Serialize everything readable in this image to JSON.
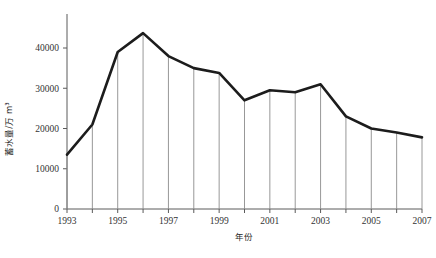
{
  "chart_data": {
    "type": "line",
    "title": "",
    "xlabel": "年份",
    "ylabel": "蓄水量/万 m³",
    "x": [
      1993,
      1994,
      1995,
      1996,
      1997,
      1998,
      1999,
      2000,
      2001,
      2002,
      2003,
      2004,
      2005,
      2006,
      2007
    ],
    "values": [
      13500,
      21000,
      39000,
      43700,
      38000,
      35000,
      33800,
      27000,
      29500,
      29000,
      31000,
      23000,
      20000,
      19000,
      17800
    ],
    "series": [
      {
        "name": "蓄水量",
        "values": [
          13500,
          21000,
          39000,
          43700,
          38000,
          35000,
          33800,
          27000,
          29500,
          29000,
          31000,
          23000,
          20000,
          19000,
          17800
        ]
      }
    ],
    "xlim": [
      1993,
      2007
    ],
    "ylim": [
      0,
      47000
    ],
    "yticks": [
      0,
      10000,
      20000,
      30000,
      40000
    ],
    "ytick_labels": [
      "0",
      "10000",
      "20000",
      "30000",
      "40000"
    ],
    "xticks": [
      1993,
      1995,
      1997,
      1999,
      2001,
      2003,
      2005,
      2007
    ],
    "xtick_labels": [
      "1993",
      "1995",
      "1997",
      "1999",
      "2001",
      "2003",
      "2005",
      "2007"
    ],
    "grid": false,
    "legend": "none",
    "drop_lines": true,
    "line_color": "#1c1c1c",
    "axis_color": "#5a5a5a",
    "drop_line_color": "#8c8c8c"
  }
}
